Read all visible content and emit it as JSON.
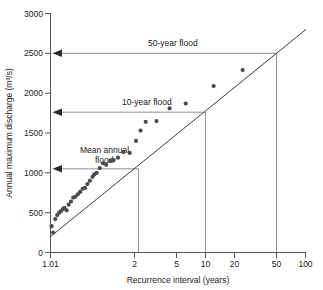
{
  "chart_data": {
    "type": "scatter",
    "title": "",
    "xlabel": "Recurrence interval (years)",
    "ylabel": "Annual maximum discharge (m³/s)",
    "xscale": "log",
    "yscale": "linear",
    "xlim": [
      1.01,
      100
    ],
    "ylim": [
      0,
      3000
    ],
    "grid": false,
    "legend": null,
    "xticks": [
      "1.01",
      "2",
      "5",
      "10",
      "20",
      "50",
      "100"
    ],
    "xtick_values": [
      1.01,
      2,
      5,
      10,
      20,
      50,
      100
    ],
    "yticks": [
      "0",
      "500",
      "1000",
      "1500",
      "2000",
      "2500",
      "3000"
    ],
    "ytick_values": [
      0,
      500,
      1000,
      1500,
      2000,
      2500,
      3000
    ],
    "series": [
      {
        "name": "Annual maximum discharge observations",
        "marker": "filled-circle",
        "color": "#4a4a4a",
        "points": [
          [
            1.03,
            330
          ],
          [
            1.06,
            250
          ],
          [
            1.1,
            420
          ],
          [
            1.14,
            470
          ],
          [
            1.18,
            500
          ],
          [
            1.22,
            520
          ],
          [
            1.26,
            545
          ],
          [
            1.3,
            560
          ],
          [
            1.35,
            530
          ],
          [
            1.4,
            600
          ],
          [
            1.46,
            640
          ],
          [
            1.52,
            690
          ],
          [
            1.58,
            700
          ],
          [
            1.65,
            730
          ],
          [
            1.72,
            760
          ],
          [
            1.8,
            800
          ],
          [
            1.88,
            810
          ],
          [
            1.96,
            860
          ],
          [
            2.05,
            900
          ],
          [
            2.15,
            950
          ],
          [
            2.22,
            980
          ],
          [
            2.32,
            1000
          ],
          [
            2.45,
            1060
          ],
          [
            2.6,
            1120
          ],
          [
            2.75,
            1100
          ],
          [
            2.95,
            1150
          ],
          [
            3.15,
            1160
          ],
          [
            3.4,
            1190
          ],
          [
            3.75,
            1260
          ],
          [
            4.2,
            1250
          ],
          [
            4.7,
            1400
          ],
          [
            5.1,
            1530
          ],
          [
            5.6,
            1640
          ],
          [
            6.8,
            1650
          ],
          [
            8.6,
            1810
          ],
          [
            11.5,
            1870
          ],
          [
            19.0,
            2090
          ],
          [
            32.0,
            2290
          ]
        ]
      }
    ],
    "fit_line": {
      "name": "Flood frequency regression line",
      "color": "#3a3a3a",
      "from": [
        1.01,
        200
      ],
      "to": [
        100,
        2800
      ]
    },
    "annotations": [
      {
        "label": "50-year flood",
        "recurrence_interval": 50,
        "discharge": 2500,
        "arrow": "left",
        "drop_line": true
      },
      {
        "label": "10-year flood",
        "recurrence_interval": 10,
        "discharge": 1760,
        "arrow": "left",
        "drop_line": true
      },
      {
        "label_line1": "Mean annual",
        "label_line2": "flood",
        "label": "Mean annual flood",
        "recurrence_interval": 2.33,
        "discharge": 1050,
        "arrow": "left",
        "drop_line": true
      }
    ]
  },
  "figure": {
    "caption_partial": ""
  }
}
